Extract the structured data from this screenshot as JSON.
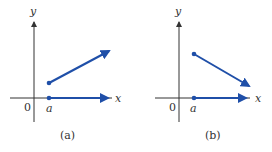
{
  "figures": [
    {
      "id": "a",
      "caption": "(a)",
      "y_axis_label": "y",
      "x_axis_label": "x",
      "origin_label": "0",
      "point_label": "a",
      "upper_ray": "increasing",
      "lower_ray": "horizontal"
    },
    {
      "id": "b",
      "caption": "(b)",
      "y_axis_label": "y",
      "x_axis_label": "x",
      "origin_label": "0",
      "point_label": "a",
      "upper_ray": "decreasing",
      "lower_ray": "horizontal"
    }
  ],
  "colors": {
    "ray": "#1f4fa8",
    "axis": "#333333"
  }
}
